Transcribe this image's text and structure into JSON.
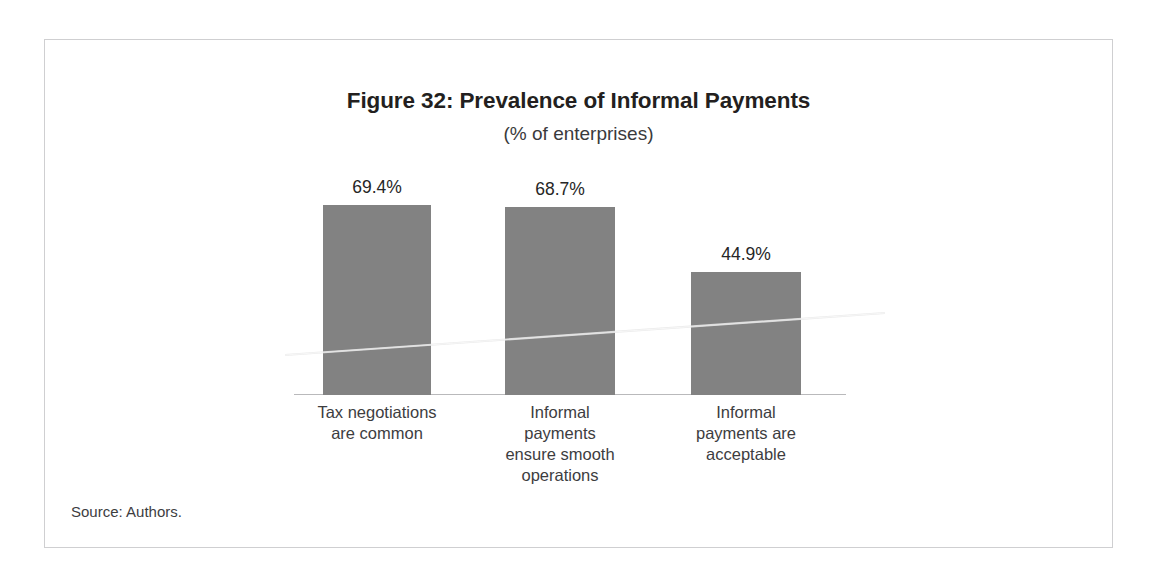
{
  "figure": {
    "title": "Figure 32: Prevalence of Informal Payments",
    "subtitle": "(% of enterprises)",
    "source": "Source: Authors."
  },
  "colors": {
    "bar_fill": "#828282",
    "frame_border": "#cfcfd1",
    "axis_line": "#b9b9bb",
    "title_text": "#231f20",
    "label_text": "#3d3d3f"
  },
  "chart_data": {
    "type": "bar",
    "title": "Figure 32: Prevalence of Informal Payments",
    "subtitle": "(% of enterprises)",
    "xlabel": "",
    "ylabel": "% of enterprises",
    "ylim": [
      0,
      100
    ],
    "grid": false,
    "legend": "none",
    "axis_visible": "x-only",
    "categories": [
      "Tax negotiations are common",
      "Informal payments ensure smooth operations",
      "Informal payments are acceptable"
    ],
    "values": [
      69.4,
      68.7,
      44.9
    ],
    "value_labels": [
      "69.4%",
      "68.7%",
      "44.9%"
    ],
    "category_label_lines": [
      [
        "Tax negotiations",
        "are common"
      ],
      [
        "Informal",
        "payments",
        "ensure smooth",
        "operations"
      ],
      [
        "Informal",
        "payments are",
        "acceptable"
      ]
    ]
  }
}
